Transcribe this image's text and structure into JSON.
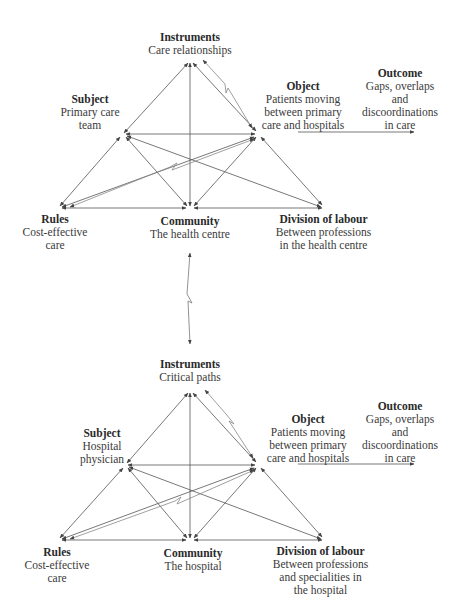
{
  "diagrams": [
    {
      "id": "primary-care",
      "nodes": {
        "instruments": {
          "title": "Instruments",
          "lines": [
            "Care relationships"
          ]
        },
        "subject": {
          "title": "Subject",
          "lines": [
            "Primary care",
            "team"
          ]
        },
        "object": {
          "title": "Object",
          "lines": [
            "Patients moving",
            "between primary",
            "care and hospitals"
          ]
        },
        "outcome": {
          "title": "Outcome",
          "lines": [
            "Gaps, overlaps",
            "and",
            "discoordinations",
            "in care"
          ]
        },
        "rules": {
          "title": "Rules",
          "lines": [
            "Cost-effective",
            "care"
          ]
        },
        "community": {
          "title": "Community",
          "lines": [
            "The health centre"
          ]
        },
        "division": {
          "title": "Division of labour",
          "lines": [
            "Between professions",
            "in the health centre"
          ]
        }
      }
    },
    {
      "id": "hospital",
      "nodes": {
        "instruments": {
          "title": "Instruments",
          "lines": [
            "Critical paths"
          ]
        },
        "subject": {
          "title": "Subject",
          "lines": [
            "Hospital",
            "physician"
          ]
        },
        "object": {
          "title": "Object",
          "lines": [
            "Patients moving",
            "between primary",
            "care and hospitals"
          ]
        },
        "outcome": {
          "title": "Outcome",
          "lines": [
            "Gaps, overlaps",
            "and",
            "discoordinations",
            "in care"
          ]
        },
        "rules": {
          "title": "Rules",
          "lines": [
            "Cost-effective",
            "care"
          ]
        },
        "community": {
          "title": "Community",
          "lines": [
            "The hospital"
          ]
        },
        "division": {
          "title": "Division of labour",
          "lines": [
            "Between professions",
            "and specialities in",
            "the hospital"
          ]
        }
      }
    }
  ],
  "colors": {
    "line": "#555555",
    "text": "#333333",
    "background": "#ffffff"
  }
}
